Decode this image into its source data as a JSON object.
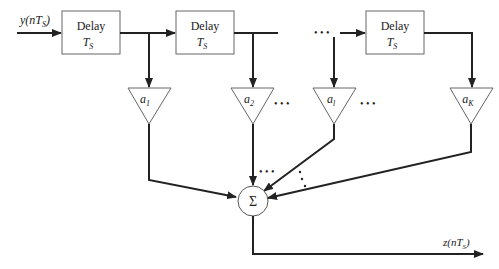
{
  "diagram": {
    "type": "tapped-delay-line FIR filter",
    "input_label": {
      "main": "y(nT",
      "sub": "S",
      "close": ")"
    },
    "output_label": {
      "main": "z(nT",
      "sub": "S",
      "close": ")"
    },
    "delay_blocks": [
      {
        "title": "Delay",
        "param": "T",
        "param_sub": "S"
      },
      {
        "title": "Delay",
        "param": "T",
        "param_sub": "S"
      },
      {
        "title": "Delay",
        "param": "T",
        "param_sub": "S"
      }
    ],
    "gains": [
      {
        "symbol": "a",
        "sub": "1"
      },
      {
        "symbol": "a",
        "sub": "2"
      },
      {
        "symbol": "a",
        "sub": "l"
      },
      {
        "symbol": "a",
        "sub": "K"
      }
    ],
    "ellipsis": "• • •",
    "summer": {
      "symbol": "Σ"
    },
    "colors": {
      "stroke": "#222222",
      "box_stroke": "#555555",
      "background": "#ffffff"
    }
  }
}
